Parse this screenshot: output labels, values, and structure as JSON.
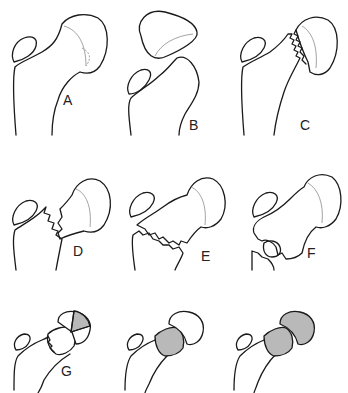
{
  "diagram": {
    "panels": [
      {
        "id": "A",
        "label": "A",
        "description": "Femoral head with small shear fragment (dashed)"
      },
      {
        "id": "B",
        "label": "B",
        "description": "Femoral head displaced/dislocated from neck"
      },
      {
        "id": "C",
        "label": "C",
        "description": "Subcapital fracture, head tilted"
      },
      {
        "id": "D",
        "label": "D",
        "description": "Transcervical fracture with displacement"
      },
      {
        "id": "E",
        "label": "E",
        "description": "Basicervical / intertrochanteric fracture"
      },
      {
        "id": "F",
        "label": "F",
        "description": "Comminuted trochanteric fracture"
      },
      {
        "id": "G",
        "label": "G",
        "description": "Femoral head with shaded wedge segment"
      },
      {
        "id": "G2",
        "label": "",
        "description": "Femoral neck segment shaded"
      },
      {
        "id": "G3",
        "label": "",
        "description": "Femoral head and neck segments shaded"
      }
    ],
    "colors": {
      "line": "#1a1a1a",
      "shading": "#b9b9b9",
      "inner_line": "#8a8a8a",
      "background": "#ffffff"
    }
  }
}
